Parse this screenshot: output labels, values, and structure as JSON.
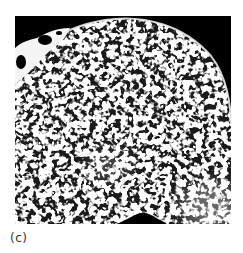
{
  "figure": {
    "panel_label": "(c)",
    "colors": {
      "background": "#000000",
      "trabeculae": "#f2f2f2",
      "label_text": "#333333",
      "page_background": "#ffffff"
    }
  }
}
